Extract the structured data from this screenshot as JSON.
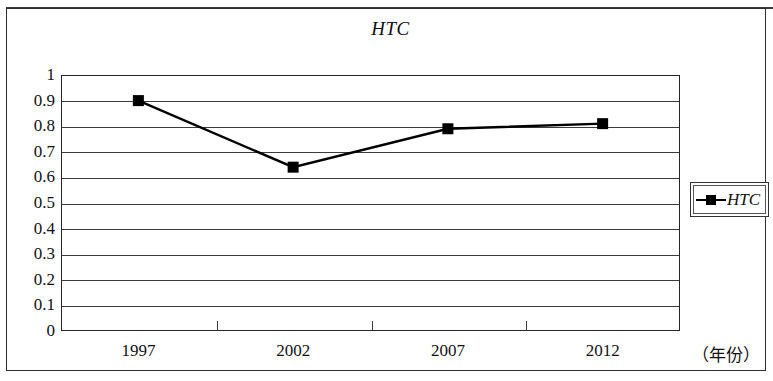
{
  "figure": {
    "title": "HTC",
    "x_axis_name": "（年份）",
    "legend": {
      "entries": [
        {
          "label": "HTC",
          "marker": "filled-square",
          "color": "#000000"
        }
      ]
    }
  },
  "chart_data": {
    "type": "line",
    "title": "HTC",
    "xlabel": "（年份）",
    "ylabel": "",
    "categories": [
      "1997",
      "2002",
      "2007",
      "2012"
    ],
    "series": [
      {
        "name": "HTC",
        "values": [
          0.9,
          0.64,
          0.79,
          0.81
        ],
        "color": "#000000",
        "marker": "filled-square"
      }
    ],
    "ylim": [
      0,
      1
    ],
    "ytick_step": 0.1,
    "yticks": [
      "1",
      "0.9",
      "0.8",
      "0.7",
      "0.6",
      "0.5",
      "0.4",
      "0.3",
      "0.2",
      "0.1",
      "0"
    ],
    "grid": "horizontal",
    "legend_position": "right"
  }
}
